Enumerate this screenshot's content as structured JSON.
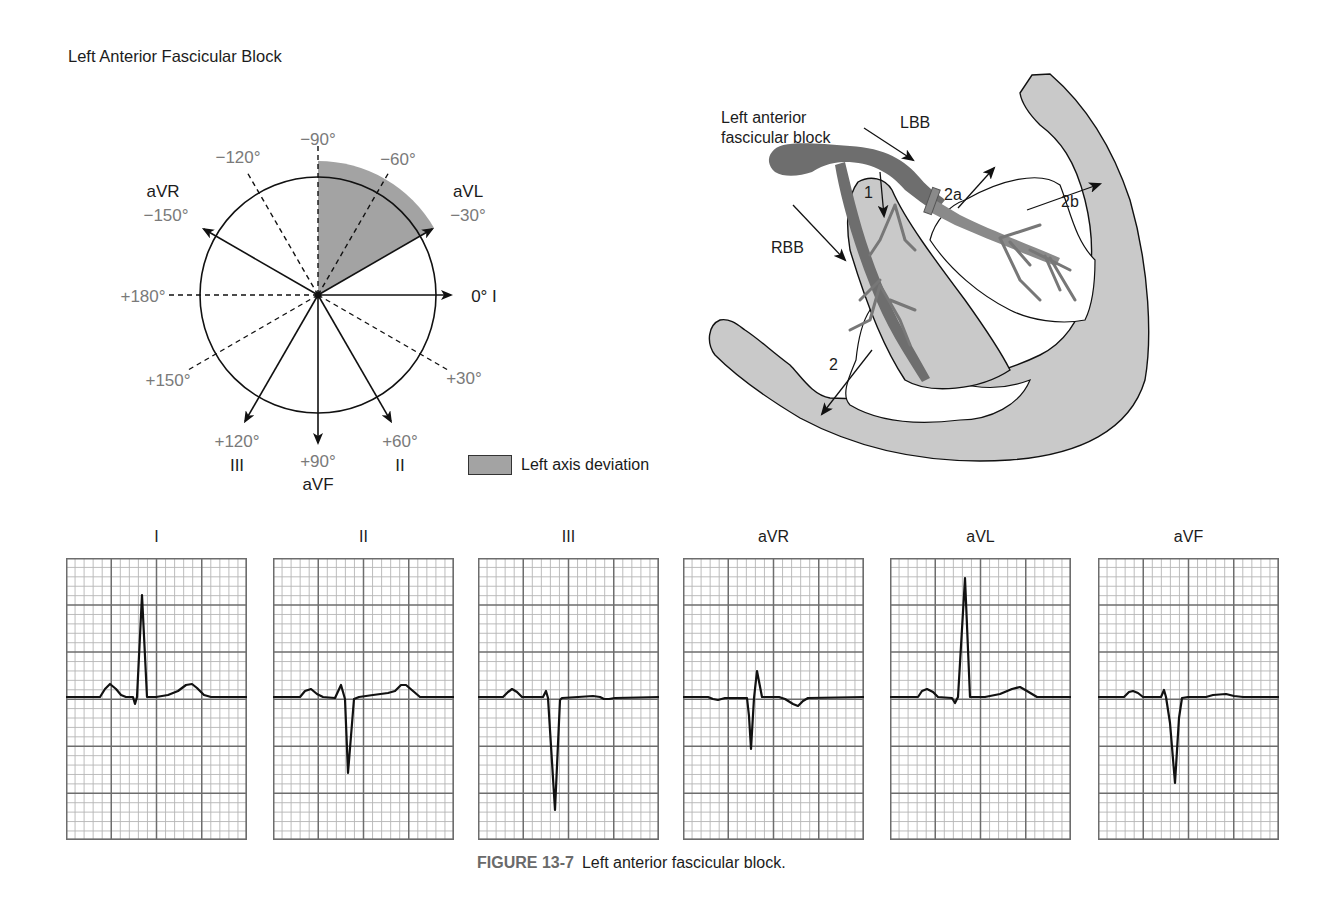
{
  "figure": {
    "caption_number": "FIGURE 13-7",
    "caption_text": "Left anterior fascicular block."
  },
  "hexaxial": {
    "title": "Left Anterior Fascicular Block",
    "center": [
      318,
      295
    ],
    "radius": 118,
    "shaded_sector": {
      "from_deg": -90,
      "to_deg": -30,
      "radius": 134,
      "color": "#a3a3a3"
    },
    "angle_labels": [
      {
        "text": "−90°",
        "x": 318,
        "y": 145
      },
      {
        "text": "−120°",
        "x": 238,
        "y": 163
      },
      {
        "text": "−60°",
        "x": 398,
        "y": 165
      },
      {
        "text": "−150°",
        "x": 166,
        "y": 221
      },
      {
        "text": "−30°",
        "x": 468,
        "y": 221
      },
      {
        "text": "+180°",
        "x": 143,
        "y": 302
      },
      {
        "text": "+150°",
        "x": 168,
        "y": 386
      },
      {
        "text": "+30°",
        "x": 464,
        "y": 384
      },
      {
        "text": "+120°",
        "x": 237,
        "y": 447
      },
      {
        "text": "+90°",
        "x": 318,
        "y": 467
      },
      {
        "text": "+60°",
        "x": 400,
        "y": 447
      }
    ],
    "lead_labels": [
      {
        "text": "aVR",
        "x": 163,
        "y": 197
      },
      {
        "text": "aVL",
        "x": 468,
        "y": 197
      },
      {
        "text": "0° I",
        "x": 484,
        "y": 302
      },
      {
        "text": "III",
        "x": 237,
        "y": 471
      },
      {
        "text": "aVF",
        "x": 318,
        "y": 490
      },
      {
        "text": "II",
        "x": 400,
        "y": 471
      }
    ],
    "legend_label": "Left axis deviation"
  },
  "heart": {
    "labels": {
      "lafb_line1": "Left anterior",
      "lafb_line2": "fascicular block",
      "lbb": "LBB",
      "rbb": "RBB",
      "l1": "1",
      "l2": "2",
      "l2a": "2a",
      "l2b": "2b"
    },
    "colors": {
      "myocardium": "#c9c9c9",
      "bundle": "#6e6e6e",
      "fascicle": "#8a8a8a"
    }
  },
  "ecg": {
    "grid": {
      "small": 9.05,
      "major": 45.25,
      "minor_color": "#b5b5b5",
      "major_color": "#6d6d6d"
    },
    "leads": [
      {
        "name": "I",
        "left": 66,
        "points": "0,139 34,139 39,131 44,126 50,131 55,137 60,139 67,139 69,146 71,139 76,37 81,139 90,139 102,137 112,133 120,127 126,126 131,130 138,137 145,139 181,139"
      },
      {
        "name": "II",
        "left": 273,
        "points": "0,139 27,139 32,133 38,131 44,136 50,139 62,140 68,127 72,141 75,215 81,141 86,139 100,137 115,135 122,133 128,127 133,127 140,133 147,139 181,139"
      },
      {
        "name": "III",
        "left": 478,
        "points": "0,139 25,139 30,134 34,131 39,134 44,139 65,139 68,133 70,140 77,252 82,142 84,140 100,139 115,138 122,139 126,141 131,141 137,140 181,139"
      },
      {
        "name": "aVR",
        "left": 683,
        "points": "0,139 25,139 30,141 35,142 42,140 64,140 66,158 68,191 71,140 74,113 79,139 96,139 102,141 110,146 115,148 120,143 125,140 181,139"
      },
      {
        "name": "aVL",
        "left": 890,
        "points": "0,139 28,139 32,133 37,131 43,134 48,139 62,140 65,145 68,139 75,20 80,139 95,139 110,136 122,131 130,129 137,133 147,139 181,139"
      },
      {
        "name": "aVF",
        "left": 1098,
        "points": "0,139 26,139 31,134 35,133 40,135 45,139 63,139 66,132 68,139 72,165 77,225 81,160 84,140 90,139 108,139 115,137 128,136 136,138 145,139 181,139"
      }
    ]
  }
}
